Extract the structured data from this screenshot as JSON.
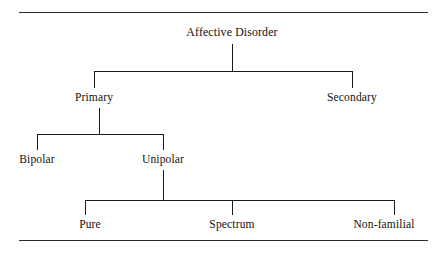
{
  "figure": {
    "type": "hierarchy-tree",
    "title_node": "Affective Disorder",
    "rules": {
      "top": "horizontal-rule",
      "bottom": "horizontal-rule"
    }
  },
  "tree": {
    "root": {
      "label": "Affective Disorder"
    },
    "level1": [
      {
        "label": "Primary"
      },
      {
        "label": "Secondary"
      }
    ],
    "level2": [
      {
        "label": "Bipolar"
      },
      {
        "label": "Unipolar"
      }
    ],
    "level3": [
      {
        "label": "Pure"
      },
      {
        "label": "Spectrum"
      },
      {
        "label": "Non-familial"
      }
    ]
  },
  "colors": {
    "line": "#1a1a1a",
    "rule": "#2a2a2a",
    "text": "#111111",
    "background": "#ffffff"
  }
}
